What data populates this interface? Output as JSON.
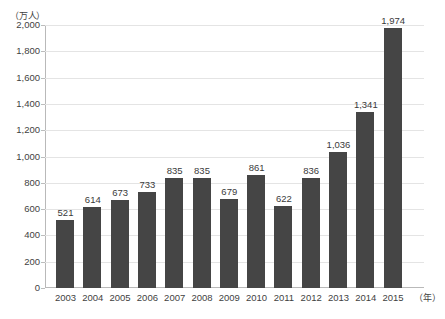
{
  "chart_data": {
    "type": "bar",
    "title": "",
    "subtitle": "",
    "xlabel": "年",
    "ylabel": "万人",
    "y_unit_caption": "（万人）",
    "x_unit_caption": "（年）",
    "categories": [
      "2003",
      "2004",
      "2005",
      "2006",
      "2007",
      "2008",
      "2009",
      "2010",
      "2011",
      "2012",
      "2013",
      "2014",
      "2015"
    ],
    "values": [
      521,
      614,
      673,
      733,
      835,
      835,
      679,
      861,
      622,
      836,
      1036,
      1341,
      1974
    ],
    "value_labels": [
      "521",
      "614",
      "673",
      "733",
      "835",
      "835",
      "679",
      "861",
      "622",
      "836",
      "1,036",
      "1,341",
      "1,974"
    ],
    "ylim": [
      0,
      2000
    ],
    "ytick_values": [
      2000,
      1800,
      1600,
      1400,
      1200,
      1000,
      800,
      600,
      400,
      200,
      0
    ],
    "ytick_labels": [
      "2,000",
      "1,800",
      "1,600",
      "1,400",
      "1,200",
      "1,000",
      "800",
      "600",
      "400",
      "200",
      "0"
    ],
    "grid": true,
    "legend": false,
    "legend_position": "none",
    "series": [
      {
        "name": "",
        "color": "#454545",
        "values": [
          521,
          614,
          673,
          733,
          835,
          835,
          679,
          861,
          622,
          836,
          1036,
          1341,
          1974
        ]
      }
    ],
    "colors": {
      "bar": "#454545",
      "gridline": "#e4e4e4",
      "axis": "#b9b9b9",
      "text": "#3a3a3a",
      "background": "#ffffff"
    }
  }
}
